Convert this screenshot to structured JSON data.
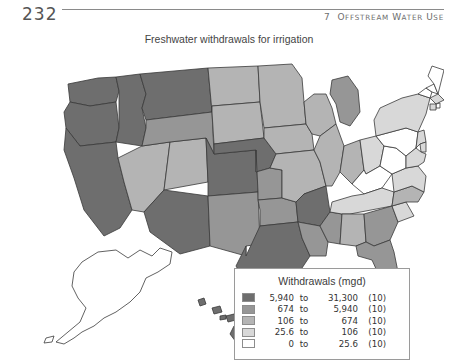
{
  "page": {
    "number": "232",
    "running_head_chapter": "7",
    "running_head_title": "Offstream Water Use"
  },
  "figure": {
    "title": "Freshwater withdrawals for irrigation"
  },
  "legend": {
    "title": "Withdrawals (mgd)",
    "to_label": "to",
    "rows": [
      {
        "swatch": "#6e6e6e",
        "low": "5,940",
        "to": "to",
        "high": "31,300",
        "count": "(10)"
      },
      {
        "swatch": "#969696",
        "low": "674",
        "to": "to",
        "high": "5,940",
        "count": "(10)"
      },
      {
        "swatch": "#b4b4b4",
        "low": "106",
        "to": "to",
        "high": "674",
        "count": "(10)"
      },
      {
        "swatch": "#d8d8d8",
        "low": "25.6",
        "to": "to",
        "high": "106",
        "count": "(10)"
      },
      {
        "swatch": "#ffffff",
        "low": "0",
        "to": "to",
        "high": "25.6",
        "count": "(10)"
      }
    ]
  },
  "chart_data": {
    "type": "heatmap",
    "title": "Freshwater withdrawals for irrigation",
    "unit": "mgd",
    "legend_position": "bottom-right",
    "class_colors": [
      "#6e6e6e",
      "#969696",
      "#b4b4b4",
      "#d8d8d8",
      "#ffffff"
    ],
    "class_breaks": [
      {
        "min": "5,940",
        "max": "31,300",
        "n": 10
      },
      {
        "min": "674",
        "max": "5,940",
        "n": 10
      },
      {
        "min": "106",
        "max": "674",
        "n": 10
      },
      {
        "min": "25.6",
        "max": "106",
        "n": 10
      },
      {
        "min": "0",
        "max": "25.6",
        "n": 10
      }
    ],
    "states": [
      {
        "code": "WA",
        "class": 1
      },
      {
        "code": "OR",
        "class": 1
      },
      {
        "code": "CA",
        "class": 1
      },
      {
        "code": "ID",
        "class": 1
      },
      {
        "code": "MT",
        "class": 1
      },
      {
        "code": "NV",
        "class": 3
      },
      {
        "code": "UT",
        "class": 3
      },
      {
        "code": "WY",
        "class": 2
      },
      {
        "code": "CO",
        "class": 1
      },
      {
        "code": "AZ",
        "class": 1
      },
      {
        "code": "NM",
        "class": 2
      },
      {
        "code": "ND",
        "class": 3
      },
      {
        "code": "SD",
        "class": 3
      },
      {
        "code": "NE",
        "class": 1
      },
      {
        "code": "KS",
        "class": 2
      },
      {
        "code": "OK",
        "class": 2
      },
      {
        "code": "TX",
        "class": 1
      },
      {
        "code": "MN",
        "class": 3
      },
      {
        "code": "IA",
        "class": 3
      },
      {
        "code": "MO",
        "class": 3
      },
      {
        "code": "AR",
        "class": 1
      },
      {
        "code": "LA",
        "class": 2
      },
      {
        "code": "WI",
        "class": 3
      },
      {
        "code": "IL",
        "class": 3
      },
      {
        "code": "MS",
        "class": 2
      },
      {
        "code": "MI",
        "class": 2
      },
      {
        "code": "IN",
        "class": 3
      },
      {
        "code": "OH",
        "class": 4
      },
      {
        "code": "KY",
        "class": 5
      },
      {
        "code": "TN",
        "class": 4
      },
      {
        "code": "AL",
        "class": 3
      },
      {
        "code": "GA",
        "class": 2
      },
      {
        "code": "FL",
        "class": 2
      },
      {
        "code": "SC",
        "class": 4
      },
      {
        "code": "NC",
        "class": 3
      },
      {
        "code": "VA",
        "class": 4
      },
      {
        "code": "WV",
        "class": 5
      },
      {
        "code": "PA",
        "class": 5
      },
      {
        "code": "NY",
        "class": 4
      },
      {
        "code": "VT",
        "class": 5
      },
      {
        "code": "NH",
        "class": 5
      },
      {
        "code": "ME",
        "class": 5
      },
      {
        "code": "MA",
        "class": 4
      },
      {
        "code": "RI",
        "class": 5
      },
      {
        "code": "CT",
        "class": 4
      },
      {
        "code": "NJ",
        "class": 4
      },
      {
        "code": "DE",
        "class": 4
      },
      {
        "code": "MD",
        "class": 4
      },
      {
        "code": "AK",
        "class": 5
      },
      {
        "code": "HI",
        "class": 1
      }
    ]
  }
}
